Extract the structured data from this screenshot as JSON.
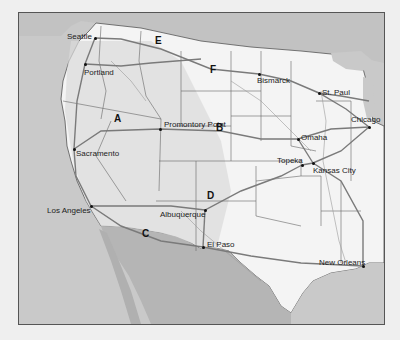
{
  "map": {
    "title": "Western United States railroad routes",
    "colors": {
      "page_bg": "#efefef",
      "ocean": "#c9c9c9",
      "land_us": "#f4f4f4",
      "land_mountain": "#d8d8d8",
      "land_foreign": "#b5b5b5",
      "border": "#555555",
      "rail": "#777777",
      "river": "#999999"
    },
    "cities": [
      {
        "name": "Seattle",
        "x": 94,
        "y": 37,
        "lx": 66,
        "ly": 32
      },
      {
        "name": "Portland",
        "x": 84,
        "y": 63,
        "lx": 83,
        "ly": 68
      },
      {
        "name": "Sacramento",
        "x": 73,
        "y": 148,
        "lx": 75,
        "ly": 149
      },
      {
        "name": "Los Angeles",
        "x": 90,
        "y": 205,
        "lx": 46,
        "ly": 206
      },
      {
        "name": "Promontory Point",
        "x": 159,
        "y": 128,
        "lx": 163,
        "ly": 120
      },
      {
        "name": "Bismarck",
        "x": 258,
        "y": 73,
        "lx": 256,
        "ly": 76
      },
      {
        "name": "St. Paul",
        "x": 318,
        "y": 92,
        "lx": 321,
        "ly": 88
      },
      {
        "name": "Chicago",
        "x": 368,
        "y": 126,
        "lx": 350,
        "ly": 115
      },
      {
        "name": "Omaha",
        "x": 297,
        "y": 138,
        "lx": 300,
        "ly": 133
      },
      {
        "name": "Topeka",
        "x": 301,
        "y": 164,
        "lx": 276,
        "ly": 156
      },
      {
        "name": "Kansas City",
        "x": 312,
        "y": 162,
        "lx": 312,
        "ly": 166
      },
      {
        "name": "Albuquerque",
        "x": 204,
        "y": 209,
        "lx": 159,
        "ly": 210
      },
      {
        "name": "El Paso",
        "x": 202,
        "y": 246,
        "lx": 206,
        "ly": 240
      },
      {
        "name": "New Orleans",
        "x": 362,
        "y": 265,
        "lx": 318,
        "ly": 258
      }
    ],
    "routes": [
      {
        "label": "A",
        "x": 117,
        "y": 118
      },
      {
        "label": "B",
        "x": 219,
        "y": 127
      },
      {
        "label": "C",
        "x": 145,
        "y": 233
      },
      {
        "label": "D",
        "x": 210,
        "y": 195
      },
      {
        "label": "E",
        "x": 158,
        "y": 40
      },
      {
        "label": "F",
        "x": 213,
        "y": 69
      }
    ]
  }
}
